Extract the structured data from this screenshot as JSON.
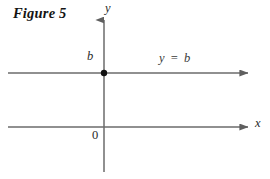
{
  "figure": {
    "caption": "Figure 5",
    "background_color": "#ffffff",
    "axis_color": "#6b6b6b",
    "line_color": "#6b6b6b",
    "point_color": "#111111",
    "text_color": "#141414"
  },
  "axes": {
    "x_axis": {
      "label": "x",
      "y_pixel": 127,
      "x_start": 8,
      "x_end": 250,
      "arrow": "right"
    },
    "y_axis": {
      "label": "y",
      "x_pixel": 104,
      "y_start": 18,
      "y_end": 172,
      "arrow": "up"
    },
    "origin_label": "0"
  },
  "graph": {
    "equation_label": "y = b",
    "intercept_label": "b",
    "line": {
      "y_pixel": 73,
      "x_start": 8,
      "x_end": 250,
      "arrow": "right",
      "style": "solid"
    },
    "point": {
      "x_pixel": 104,
      "y_pixel": 73,
      "radius": 3.2,
      "filled": true
    }
  }
}
